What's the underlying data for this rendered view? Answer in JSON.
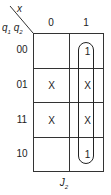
{
  "kmap": {
    "title": "J2",
    "title_main": "J",
    "title_sub": "2",
    "column_variable": "x",
    "row_variables": {
      "first": "q",
      "first_sub": "1",
      "second": "q",
      "second_sub": "2"
    },
    "column_headers": [
      "0",
      "1"
    ],
    "row_headers": [
      "00",
      "01",
      "11",
      "10"
    ],
    "cells": [
      [
        "",
        "1"
      ],
      [
        "X",
        "X"
      ],
      [
        "X",
        "X"
      ],
      [
        "",
        "1"
      ]
    ],
    "groups": [
      {
        "column": 1,
        "rows": [
          0,
          1,
          2,
          3
        ],
        "shape": "rounded-loop"
      }
    ]
  }
}
